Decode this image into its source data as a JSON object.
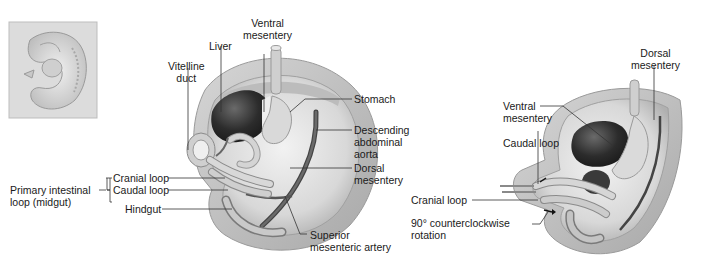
{
  "figure": {
    "inset": {
      "label": "embryo-thumbnail"
    },
    "left_panel": {
      "labels": {
        "ventral_mesentery": [
          "Ventral",
          "mesentery"
        ],
        "liver": "Liver",
        "vitelline_duct": [
          "Vitelline",
          "duct"
        ],
        "stomach": "Stomach",
        "descending_aorta": [
          "Descending",
          "abdominal",
          "aorta"
        ],
        "dorsal_mesentery": [
          "Dorsal",
          "mesentery"
        ],
        "cranial_loop": "Cranial loop",
        "caudal_loop": "Caudal loop",
        "primary_intestinal_loop": [
          "Primary intestinal",
          "loop (midgut)"
        ],
        "hindgut": "Hindgut",
        "superior_mesenteric_artery": [
          "Superior",
          "mesenteric artery"
        ]
      }
    },
    "right_panel": {
      "labels": {
        "dorsal_mesentery": [
          "Dorsal",
          "mesentery"
        ],
        "ventral_mesentery": [
          "Ventral",
          "mesentery"
        ],
        "caudal_loop": "Caudal loop",
        "cranial_loop": "Cranial loop",
        "rotation": [
          "90° counterclockwise",
          "rotation"
        ]
      }
    },
    "colors": {
      "background": "#ffffff",
      "tissue_light": "#e4e4e4",
      "tissue_mid": "#c4c4c4",
      "tissue_dark": "#8a8a8a",
      "liver": "#2e2e2e",
      "aorta": "#555555",
      "leader_line": "#333333",
      "text": "#1a1a1a"
    }
  }
}
